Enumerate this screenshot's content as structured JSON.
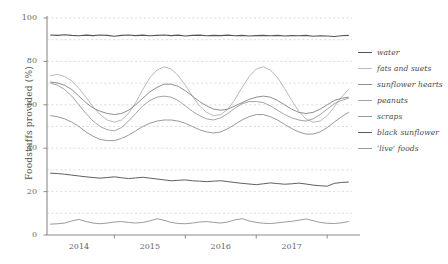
{
  "chart_data": {
    "type": "line",
    "title": "",
    "xlabel": "",
    "ylabel": "Foodstuffs provided (%)",
    "xlim": [
      2013.55,
      2017.85
    ],
    "ylim": [
      0,
      100
    ],
    "grid": true,
    "grid_interval": 10,
    "legend_position": "right",
    "ytick_labels": [
      "0",
      "20",
      "40",
      "60",
      "80",
      "100"
    ],
    "ytick_values": [
      0,
      20,
      40,
      60,
      80,
      100
    ],
    "xtick_labels": [
      "2014",
      "2015",
      "2016",
      "2017"
    ],
    "xtick_values": [
      2014,
      2015,
      2016,
      2017
    ],
    "x": [
      2013.6,
      2013.7,
      2013.8,
      2013.9,
      2014.0,
      2014.1,
      2014.2,
      2014.3,
      2014.4,
      2014.5,
      2014.6,
      2014.7,
      2014.8,
      2014.9,
      2015.0,
      2015.1,
      2015.2,
      2015.3,
      2015.4,
      2015.5,
      2015.6,
      2015.7,
      2015.8,
      2015.9,
      2016.0,
      2016.1,
      2016.2,
      2016.3,
      2016.4,
      2016.5,
      2016.6,
      2016.7,
      2016.8,
      2016.9,
      2017.0,
      2017.1,
      2017.2,
      2017.3,
      2017.4,
      2017.5,
      2017.6,
      2017.7,
      2017.8
    ],
    "series": [
      {
        "name": "water",
        "color": "#555555",
        "width": 1.1,
        "values": [
          92.2,
          92.0,
          92.3,
          92.0,
          91.8,
          92.1,
          91.9,
          92.2,
          92.0,
          91.6,
          92.0,
          92.2,
          91.9,
          92.1,
          91.8,
          92.0,
          92.2,
          91.9,
          92.1,
          91.7,
          92.0,
          92.1,
          91.8,
          92.0,
          91.9,
          92.1,
          91.8,
          92.0,
          91.7,
          91.9,
          92.0,
          91.8,
          92.0,
          91.7,
          91.9,
          91.8,
          92.0,
          91.6,
          91.8,
          91.7,
          91.5,
          91.8,
          92.0
        ]
      },
      {
        "name": "fats and suets",
        "color": "#b9b9b9",
        "width": 1.0,
        "values": [
          73.5,
          74.0,
          73.0,
          71.0,
          67.5,
          63.5,
          59.0,
          55.5,
          53.0,
          52.0,
          53.0,
          56.0,
          61.0,
          67.0,
          72.5,
          76.0,
          77.5,
          76.5,
          73.5,
          69.0,
          64.0,
          59.5,
          56.5,
          55.0,
          55.5,
          58.0,
          62.5,
          68.0,
          73.0,
          76.5,
          77.5,
          76.0,
          72.5,
          67.5,
          62.0,
          57.0,
          53.5,
          52.0,
          52.5,
          55.0,
          59.0,
          63.5,
          67.0
        ]
      },
      {
        "name": "sunflower hearts",
        "color": "#8f8f8f",
        "width": 1.0,
        "values": [
          70.5,
          70.0,
          69.0,
          67.0,
          64.0,
          61.0,
          58.5,
          57.0,
          56.0,
          55.5,
          56.0,
          57.5,
          60.0,
          63.0,
          66.0,
          68.0,
          69.5,
          69.5,
          68.5,
          66.5,
          64.0,
          61.5,
          59.5,
          58.0,
          57.5,
          58.0,
          59.5,
          61.0,
          62.5,
          63.5,
          64.0,
          63.5,
          62.0,
          60.0,
          58.0,
          56.5,
          56.0,
          56.5,
          58.0,
          60.0,
          62.0,
          63.0,
          63.5
        ]
      },
      {
        "name": "peanuts",
        "color": "#a5a5a5",
        "width": 1.0,
        "values": [
          70.0,
          69.0,
          67.0,
          64.0,
          60.0,
          56.0,
          52.5,
          50.0,
          48.5,
          48.0,
          49.5,
          52.5,
          56.0,
          59.5,
          62.0,
          63.5,
          64.0,
          63.5,
          62.0,
          59.5,
          57.0,
          55.0,
          53.5,
          53.0,
          54.0,
          56.0,
          58.5,
          60.5,
          61.5,
          61.5,
          61.0,
          59.5,
          57.5,
          55.5,
          54.0,
          53.0,
          52.5,
          53.5,
          55.5,
          58.0,
          60.5,
          62.0,
          63.0
        ]
      },
      {
        "name": "scraps",
        "color": "#9a9a9a",
        "width": 1.0,
        "values": [
          55.0,
          54.5,
          53.5,
          52.0,
          50.0,
          47.5,
          45.5,
          44.0,
          43.5,
          43.5,
          44.5,
          46.0,
          48.0,
          50.0,
          51.5,
          52.5,
          53.0,
          53.0,
          52.5,
          51.5,
          50.0,
          48.5,
          47.5,
          47.0,
          47.5,
          49.0,
          51.0,
          53.0,
          54.5,
          55.5,
          55.5,
          54.5,
          53.0,
          51.0,
          49.0,
          47.5,
          46.5,
          46.5,
          47.5,
          49.5,
          52.0,
          54.5,
          56.5
        ]
      },
      {
        "name": "black sunflower",
        "color": "#606060",
        "width": 1.0,
        "values": [
          28.5,
          28.3,
          28.0,
          27.6,
          27.2,
          26.8,
          26.5,
          26.2,
          26.5,
          26.8,
          26.4,
          26.0,
          26.3,
          26.6,
          26.2,
          25.8,
          25.4,
          25.0,
          25.2,
          25.4,
          25.0,
          24.8,
          24.6,
          24.8,
          25.0,
          24.6,
          24.2,
          23.8,
          23.5,
          23.2,
          23.6,
          24.0,
          23.7,
          23.4,
          23.6,
          23.9,
          23.5,
          23.0,
          22.7,
          22.5,
          23.8,
          24.2,
          24.4
        ]
      },
      {
        "name": "'live' foods",
        "color": "#9c9c9c",
        "width": 1.0,
        "values": [
          5.0,
          5.2,
          5.5,
          6.5,
          7.2,
          6.2,
          5.5,
          5.2,
          5.5,
          6.0,
          6.2,
          5.8,
          5.5,
          5.8,
          6.5,
          7.5,
          6.8,
          5.8,
          5.3,
          5.2,
          5.5,
          6.0,
          6.2,
          5.8,
          5.5,
          6.0,
          7.0,
          7.5,
          6.5,
          5.8,
          5.4,
          5.3,
          5.6,
          6.0,
          6.3,
          6.8,
          7.4,
          6.6,
          5.8,
          5.4,
          5.3,
          5.6,
          6.2
        ]
      }
    ]
  },
  "legend": {
    "items": [
      {
        "label": "water",
        "color": "#555555",
        "width": 1.6
      },
      {
        "label": "fats and suets",
        "color": "#bcbcbc",
        "width": 1.2
      },
      {
        "label": "sunflower hearts",
        "color": "#8f8f8f",
        "width": 1.4
      },
      {
        "label": "peanuts",
        "color": "#a5a5a5",
        "width": 1.2
      },
      {
        "label": "scraps",
        "color": "#9a9a9a",
        "width": 1.3
      },
      {
        "label": "black sunflower",
        "color": "#5a5a5a",
        "width": 1.7
      },
      {
        "label": "'live' foods",
        "color": "#9c9c9c",
        "width": 1.2
      }
    ]
  },
  "axes": {
    "y_title": "Foodstuffs provided (%)",
    "y_ticks": [
      "100",
      "80",
      "60",
      "40",
      "20",
      "0"
    ],
    "x_ticks": [
      "2014",
      "2015",
      "2016",
      "2017"
    ]
  }
}
